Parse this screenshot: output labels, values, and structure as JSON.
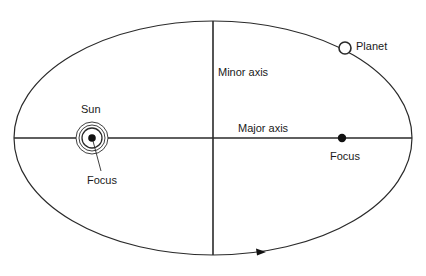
{
  "diagram": {
    "type": "orbital-ellipse",
    "colors": {
      "line": "#2a2a2a",
      "background": "#ffffff"
    },
    "labels": {
      "planet": "Planet",
      "minor_axis": "Minor axis",
      "major_axis": "Major axis",
      "sun": "Sun",
      "sun_focus": "Focus",
      "empty_focus": "Focus"
    }
  }
}
